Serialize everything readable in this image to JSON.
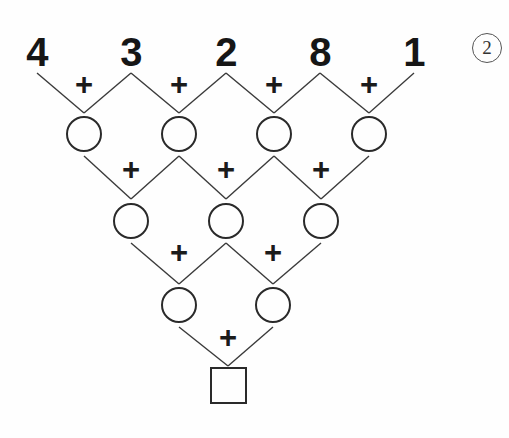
{
  "puzzle": {
    "type": "addition-pyramid",
    "problem_number": "2",
    "problem_number_marker": "circled-number",
    "operator_symbol": "+",
    "top_row_values": [
      "4",
      "3",
      "2",
      "8",
      "1"
    ],
    "rows": [
      {
        "index": 0,
        "kind": "given-digits",
        "cells": [
          "4",
          "3",
          "2",
          "8",
          "1"
        ],
        "centers_x": [
          37,
          131,
          226,
          320,
          414
        ],
        "center_y": 52
      },
      {
        "index": 1,
        "kind": "empty-circles",
        "cells": [
          "",
          "",
          "",
          ""
        ],
        "centers_x": [
          84,
          179,
          274,
          369
        ],
        "center_y": 134
      },
      {
        "index": 2,
        "kind": "empty-circles",
        "cells": [
          "",
          "",
          ""
        ],
        "centers_x": [
          131,
          226,
          321
        ],
        "center_y": 221
      },
      {
        "index": 3,
        "kind": "empty-circles",
        "cells": [
          "",
          ""
        ],
        "centers_x": [
          179,
          273
        ],
        "center_y": 305
      },
      {
        "index": 4,
        "kind": "empty-square",
        "cells": [
          ""
        ],
        "centers_x": [
          228
        ],
        "center_y": 385
      }
    ],
    "operators": [
      {
        "row": 0,
        "centers_x": [
          84,
          179,
          274,
          369
        ],
        "center_y": 85,
        "symbol": "+"
      },
      {
        "row": 1,
        "centers_x": [
          131,
          226,
          321
        ],
        "center_y": 170,
        "symbol": "+"
      },
      {
        "row": 2,
        "centers_x": [
          179,
          273
        ],
        "center_y": 253,
        "symbol": "+"
      },
      {
        "row": 3,
        "centers_x": [
          228
        ],
        "center_y": 338,
        "symbol": "+"
      }
    ],
    "connectors": [
      {
        "from_x": 37,
        "from_y": 73,
        "to_x": 84,
        "to_y": 113
      },
      {
        "from_x": 131,
        "from_y": 73,
        "to_x": 84,
        "to_y": 113
      },
      {
        "from_x": 131,
        "from_y": 73,
        "to_x": 179,
        "to_y": 113
      },
      {
        "from_x": 226,
        "from_y": 73,
        "to_x": 179,
        "to_y": 113
      },
      {
        "from_x": 226,
        "from_y": 73,
        "to_x": 274,
        "to_y": 113
      },
      {
        "from_x": 320,
        "from_y": 73,
        "to_x": 274,
        "to_y": 113
      },
      {
        "from_x": 320,
        "from_y": 73,
        "to_x": 369,
        "to_y": 113
      },
      {
        "from_x": 414,
        "from_y": 73,
        "to_x": 369,
        "to_y": 113
      },
      {
        "from_x": 84,
        "from_y": 156,
        "to_x": 131,
        "to_y": 199
      },
      {
        "from_x": 179,
        "from_y": 156,
        "to_x": 131,
        "to_y": 199
      },
      {
        "from_x": 179,
        "from_y": 156,
        "to_x": 226,
        "to_y": 199
      },
      {
        "from_x": 274,
        "from_y": 156,
        "to_x": 226,
        "to_y": 199
      },
      {
        "from_x": 274,
        "from_y": 156,
        "to_x": 321,
        "to_y": 199
      },
      {
        "from_x": 369,
        "from_y": 156,
        "to_x": 321,
        "to_y": 199
      },
      {
        "from_x": 131,
        "from_y": 243,
        "to_x": 179,
        "to_y": 284
      },
      {
        "from_x": 226,
        "from_y": 243,
        "to_x": 179,
        "to_y": 284
      },
      {
        "from_x": 226,
        "from_y": 243,
        "to_x": 273,
        "to_y": 284
      },
      {
        "from_x": 321,
        "from_y": 243,
        "to_x": 273,
        "to_y": 284
      },
      {
        "from_x": 179,
        "from_y": 327,
        "to_x": 228,
        "to_y": 366
      },
      {
        "from_x": 273,
        "from_y": 327,
        "to_x": 228,
        "to_y": 366
      }
    ],
    "geometry": {
      "circle_diameter": 36,
      "square_size": 37,
      "marker_diameter": 30,
      "marker_center_x": 487,
      "marker_center_y": 48
    },
    "colors": {
      "ink": "#2a2a2a",
      "digit": "#161616",
      "line": "#3a3a3a",
      "marker": "#555555",
      "background": "#fefefe"
    }
  }
}
